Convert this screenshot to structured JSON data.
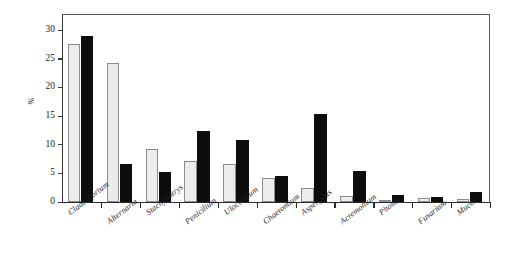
{
  "chart_data": {
    "type": "bar",
    "title": "",
    "xlabel": "",
    "ylabel": "%",
    "ylim": [
      0,
      33
    ],
    "yticks": [
      0,
      5,
      10,
      15,
      20,
      25,
      30
    ],
    "grid": false,
    "legend": "none",
    "categories": [
      "Cladosporium",
      "Alternaria",
      "Stachybotrys",
      "Penicilium",
      "Ulocladium",
      "Chaetomium",
      "Aspergilus",
      "Acremonium",
      "Phoma",
      "Fusarium",
      "Mucor"
    ],
    "series": [
      {
        "name": "series-1",
        "color": "#ececec",
        "values": [
          27.6,
          24.2,
          9.2,
          7.2,
          6.6,
          4.2,
          2.4,
          1.0,
          0.4,
          0.7,
          0.5
        ]
      },
      {
        "name": "series-2",
        "color": "#0d0d0d",
        "values": [
          28.9,
          6.7,
          5.2,
          12.4,
          10.9,
          4.6,
          15.3,
          5.5,
          1.3,
          0.8,
          1.8
        ]
      }
    ]
  },
  "axis": {
    "y_label_text": "%",
    "tick_labels": [
      "0",
      "5",
      "10",
      "15",
      "20",
      "25",
      "30"
    ]
  }
}
